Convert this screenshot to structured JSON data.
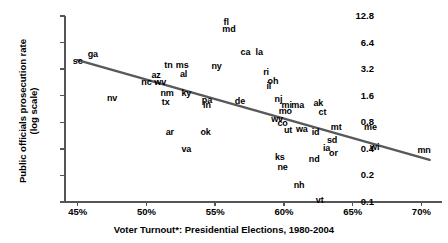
{
  "chart_data": {
    "type": "scatter",
    "title": "",
    "xlabel": "Voter Turnout*: Presidential Elections, 1980-2004",
    "ylabel": "Public officials prosecution rate\n(log scale)",
    "y_scale": "log",
    "xlim": [
      44.0,
      71.5
    ],
    "ylim": [
      0.1,
      12.8
    ],
    "xticks": [
      "45%",
      "50%",
      "55%",
      "60%",
      "65%",
      "70%"
    ],
    "xtick_values": [
      45,
      50,
      55,
      60,
      65,
      70
    ],
    "yticks": [
      "12.8",
      "6.4",
      "3.2",
      "1.6",
      "0.8",
      "0.4",
      "0.2",
      "0.1"
    ],
    "ytick_values": [
      12.8,
      6.4,
      3.2,
      1.6,
      0.8,
      0.4,
      0.2,
      0.1
    ],
    "grid": false,
    "legend": false,
    "point_label_style": "state-abbreviation",
    "trendline": {
      "visible": true,
      "color": "#595959",
      "x_start": 45.0,
      "y_start": 4.05,
      "x_end": 70.6,
      "y_end": 0.3
    },
    "points": [
      {
        "label": "sc",
        "x": 45.0,
        "y": 3.95
      },
      {
        "label": "ga",
        "x": 46.1,
        "y": 4.75
      },
      {
        "label": "nv",
        "x": 47.5,
        "y": 1.5
      },
      {
        "label": "nc",
        "x": 50.0,
        "y": 2.3
      },
      {
        "label": "az",
        "x": 50.7,
        "y": 2.75
      },
      {
        "label": "wv",
        "x": 51.0,
        "y": 2.3
      },
      {
        "label": "tn",
        "x": 51.6,
        "y": 3.6
      },
      {
        "label": "ms",
        "x": 52.6,
        "y": 3.6
      },
      {
        "label": "al",
        "x": 52.7,
        "y": 2.85
      },
      {
        "label": "nm",
        "x": 51.5,
        "y": 1.7
      },
      {
        "label": "ky",
        "x": 52.9,
        "y": 1.72
      },
      {
        "label": "tx",
        "x": 51.4,
        "y": 1.35
      },
      {
        "label": "ar",
        "x": 51.7,
        "y": 0.62
      },
      {
        "label": "va",
        "x": 52.9,
        "y": 0.4
      },
      {
        "label": "ok",
        "x": 54.3,
        "y": 0.62
      },
      {
        "label": "pa",
        "x": 54.4,
        "y": 1.42
      },
      {
        "label": "in",
        "x": 54.4,
        "y": 1.25
      },
      {
        "label": "ny",
        "x": 55.1,
        "y": 3.45
      },
      {
        "label": "fl",
        "x": 55.8,
        "y": 11.0
      },
      {
        "label": "md",
        "x": 56.0,
        "y": 9.2
      },
      {
        "label": "ca",
        "x": 57.2,
        "y": 5.0
      },
      {
        "label": "la",
        "x": 58.2,
        "y": 5.0
      },
      {
        "label": "de",
        "x": 56.8,
        "y": 1.4
      },
      {
        "label": "ri",
        "x": 58.7,
        "y": 2.95
      },
      {
        "label": "oh",
        "x": 59.2,
        "y": 2.35
      },
      {
        "label": "il",
        "x": 58.9,
        "y": 2.05
      },
      {
        "label": "nj",
        "x": 59.6,
        "y": 1.45
      },
      {
        "label": "mi",
        "x": 60.2,
        "y": 1.25
      },
      {
        "label": "ma",
        "x": 61.0,
        "y": 1.25
      },
      {
        "label": "mo",
        "x": 60.1,
        "y": 1.08
      },
      {
        "label": "wv2",
        "x": 59.5,
        "y": 0.87
      },
      {
        "label": "co",
        "x": 59.9,
        "y": 0.78
      },
      {
        "label": "ut",
        "x": 60.3,
        "y": 0.65
      },
      {
        "label": "wa",
        "x": 61.3,
        "y": 0.68
      },
      {
        "label": "ks",
        "x": 59.7,
        "y": 0.32
      },
      {
        "label": "ne",
        "x": 59.9,
        "y": 0.25
      },
      {
        "label": "ak",
        "x": 62.5,
        "y": 1.32
      },
      {
        "label": "ct",
        "x": 62.8,
        "y": 1.05
      },
      {
        "label": "id",
        "x": 62.3,
        "y": 0.62
      },
      {
        "label": "mt",
        "x": 63.8,
        "y": 0.7
      },
      {
        "label": "sd",
        "x": 63.5,
        "y": 0.5
      },
      {
        "label": "ia",
        "x": 63.1,
        "y": 0.41
      },
      {
        "label": "or",
        "x": 63.6,
        "y": 0.36
      },
      {
        "label": "nd",
        "x": 62.2,
        "y": 0.31
      },
      {
        "label": "nh",
        "x": 61.1,
        "y": 0.155
      },
      {
        "label": "vt",
        "x": 62.6,
        "y": 0.105
      },
      {
        "label": "me",
        "x": 66.3,
        "y": 0.7
      },
      {
        "label": "wi",
        "x": 66.6,
        "y": 0.42
      },
      {
        "label": "mn",
        "x": 70.2,
        "y": 0.39
      }
    ],
    "point_display_labels": {
      "wv2": "wv"
    }
  }
}
